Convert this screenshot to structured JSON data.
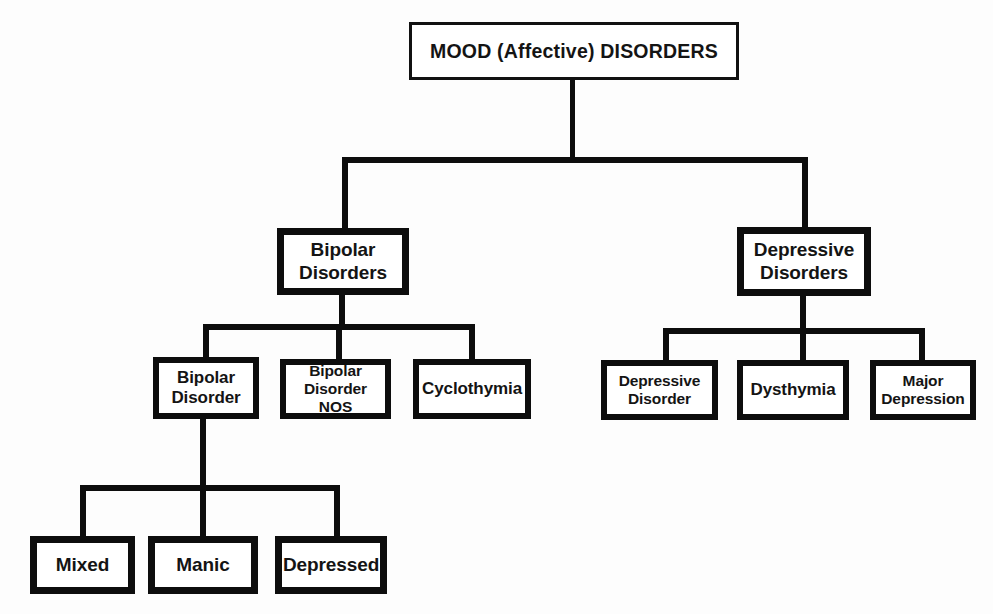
{
  "diagram": {
    "title": "MOOD (Affective) DISORDERS",
    "type": "hierarchy-tree",
    "orientation": "top-down",
    "background_color": "#fdfdfd",
    "line_color": "#0d0d0d",
    "text_color": "#141414",
    "nodes": {
      "root": "MOOD (Affective) DISORDERS",
      "bipolar_disorders": {
        "line1": "Bipolar",
        "line2": "Disorders"
      },
      "depressive_disorders": {
        "line1": "Depressive",
        "line2": "Disorders"
      },
      "bipolar_disorder": {
        "line1": "Bipolar",
        "line2": "Disorder"
      },
      "bipolar_disorder_nos": {
        "line1": "Bipolar",
        "line2": "Disorder NOS"
      },
      "cyclothymia": "Cyclothymia",
      "depressive_disorder": {
        "line1": "Depressive",
        "line2": "Disorder"
      },
      "dysthymia": "Dysthymia",
      "major_depression": {
        "line1": "Major",
        "line2": "Depression"
      },
      "mixed": "Mixed",
      "manic": "Manic",
      "depressed": "Depressed"
    }
  }
}
